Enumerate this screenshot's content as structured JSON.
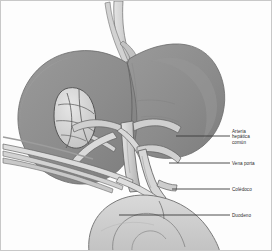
{
  "figure": {
    "type": "medical-illustration",
    "palette": {
      "background": "#fdfdfd",
      "border": "#c8c8c8",
      "liver_fill": "#8f8f8f",
      "liver_shade": "#7c7c7c",
      "liver_light": "#9c9c9c",
      "gallbladder": "#d6d6d6",
      "vessel_light": "#dcdcdc",
      "vessel_mid": "#bdbdbd",
      "duodenum": "#cfcfcf",
      "outline": "#5a5a5a",
      "leader_line": "#3a3a3a",
      "label_text": "#2b2b2b"
    }
  },
  "labels": [
    {
      "id": "arteria",
      "text": "Arteria\nhepática\ncomún",
      "leader_x1": 175,
      "leader_x2": 229,
      "leader_y": 135
    },
    {
      "id": "vena",
      "text": "Vena porta",
      "leader_x1": 168,
      "leader_x2": 229,
      "leader_y": 162
    },
    {
      "id": "coledoco",
      "text": "Colédoco",
      "leader_x1": 171,
      "leader_x2": 229,
      "leader_y": 188
    },
    {
      "id": "duodeno",
      "text": "Duodeno",
      "leader_x1": 118,
      "leader_x2": 229,
      "leader_y": 214
    }
  ],
  "structures": {
    "liver": "Hígado",
    "gallbladder": "Vesícula biliar",
    "vena_cava": "Vena cava inferior",
    "duodenum": "Duodeno",
    "splenic_vessels": "Vasos esplénicos"
  }
}
